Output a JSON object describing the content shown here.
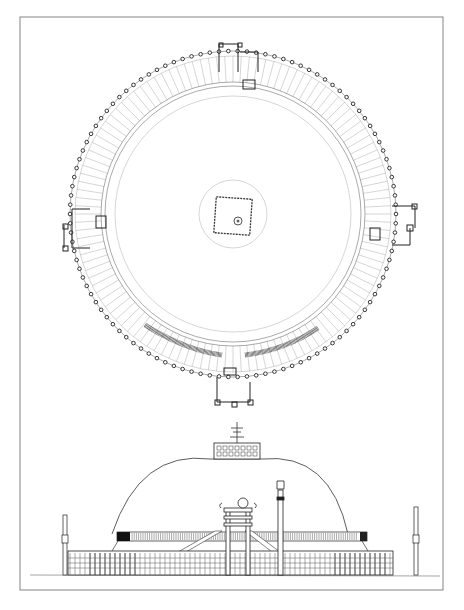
{
  "figure": {
    "panels": [
      {
        "id": "plan",
        "label": "Plan view"
      },
      {
        "id": "elevation",
        "label": "Elevation view"
      }
    ],
    "gateways_in_plan": [
      "north",
      "west",
      "east",
      "south"
    ],
    "colors": {
      "ink": "#2a2a2a",
      "frame": "#777777",
      "paper": "#ffffff"
    }
  }
}
